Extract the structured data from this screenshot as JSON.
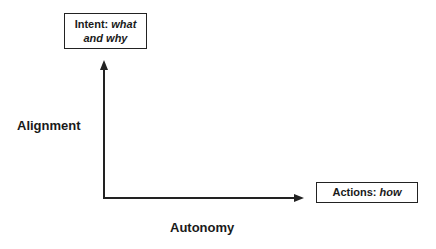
{
  "diagram": {
    "y_axis": {
      "label": "Alignment",
      "end_box": {
        "prefix": "Intent: ",
        "emphasis": "what and why"
      }
    },
    "x_axis": {
      "label": "Autonomy",
      "end_box": {
        "prefix": "Actions: ",
        "emphasis": "how"
      }
    },
    "colors": {
      "stroke": "#222222",
      "text": "#1a1a1a",
      "background": "#ffffff"
    }
  }
}
